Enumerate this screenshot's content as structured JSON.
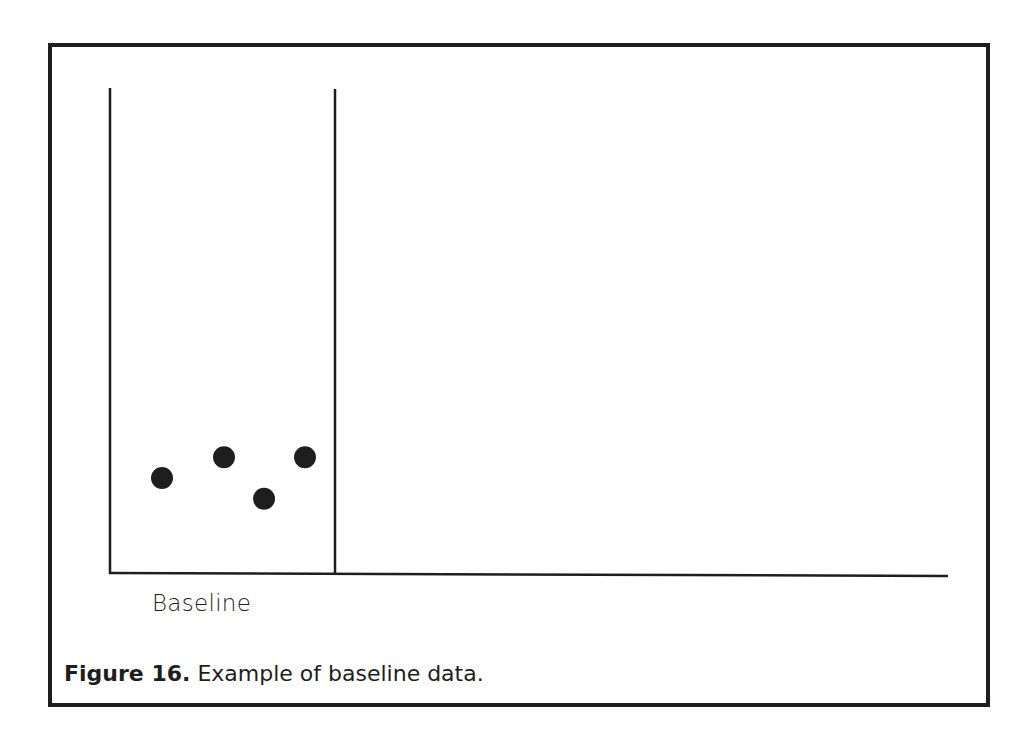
{
  "chart_data": {
    "type": "scatter",
    "title": "",
    "caption_label": "Figure 16.",
    "caption_text": " Example of baseline data.",
    "xlabel": "",
    "ylabel": "",
    "phases": [
      {
        "name": "Baseline",
        "x_start": 0,
        "x_end": 5
      }
    ],
    "phase_change_line_x": 5,
    "x": [
      1,
      2,
      3,
      4
    ],
    "values": [
      5,
      6,
      4,
      6
    ],
    "ylim": [
      0,
      24
    ],
    "grid": false,
    "legend": null,
    "marker": "filled-circle",
    "marker_color": "#1e1e1e"
  },
  "phase_label": "Baseline",
  "caption": {
    "label": "Figure 16.",
    "text": " Example of baseline data."
  }
}
